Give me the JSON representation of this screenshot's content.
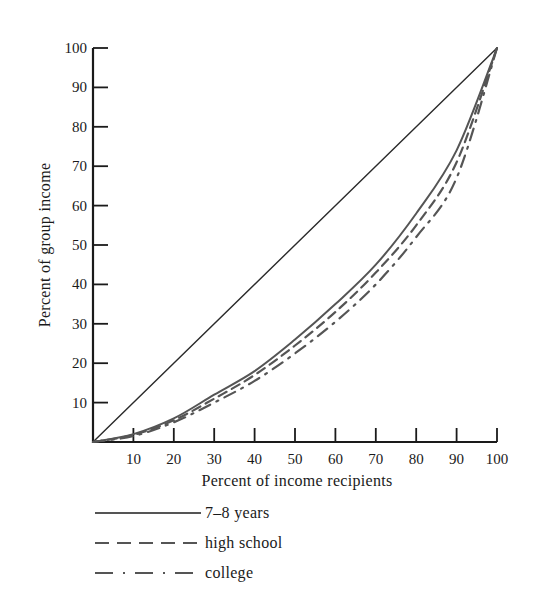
{
  "chart_data": {
    "type": "line",
    "title": "",
    "xlabel": "Percent of income recipients",
    "ylabel": "Percent of group income",
    "xlim": [
      0,
      100
    ],
    "ylim": [
      0,
      100
    ],
    "grid": false,
    "legend_position": "below",
    "x_ticks": [
      "10",
      "20",
      "30",
      "40",
      "50",
      "60",
      "70",
      "80",
      "90",
      "100"
    ],
    "y_ticks": [
      "10",
      "20",
      "30",
      "40",
      "50",
      "60",
      "70",
      "80",
      "90",
      "100"
    ],
    "x": [
      0,
      10,
      20,
      30,
      40,
      50,
      60,
      70,
      80,
      90,
      100
    ],
    "series": [
      {
        "name": "Line of equality",
        "style": "solid-thin",
        "values": [
          0,
          10,
          20,
          30,
          40,
          50,
          60,
          70,
          80,
          90,
          100
        ]
      },
      {
        "name": "7–8 years",
        "style": "solid",
        "values": [
          0,
          2,
          6,
          12,
          18,
          26,
          35,
          45,
          58,
          74,
          100
        ]
      },
      {
        "name": "high school",
        "style": "dashed",
        "values": [
          0,
          1.8,
          5.5,
          11,
          17,
          24.5,
          33,
          43,
          55,
          71,
          100
        ]
      },
      {
        "name": "college",
        "style": "dash-dot",
        "values": [
          0,
          1.5,
          5,
          10,
          15.5,
          22.5,
          30.5,
          40,
          52,
          67,
          100
        ]
      }
    ]
  },
  "axes": {
    "x_label": "Percent of income recipients",
    "y_label": "Percent of group income"
  },
  "legend": [
    {
      "label": "7–8 years",
      "style": "solid"
    },
    {
      "label": "high school",
      "style": "dashed"
    },
    {
      "label": "college",
      "style": "dash-dot"
    }
  ],
  "colors": {
    "axis": "#1a1a1a",
    "equality_line": "#2a2a2a",
    "curves": "#555555"
  }
}
